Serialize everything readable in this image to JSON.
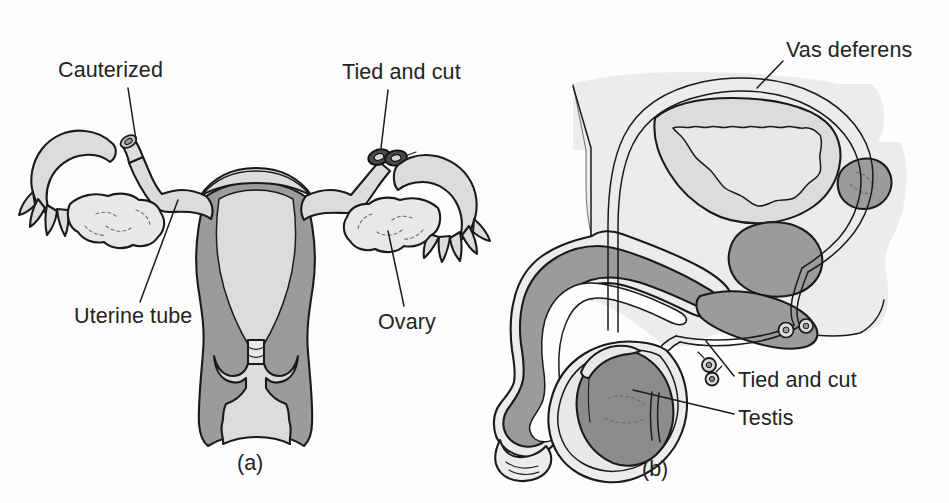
{
  "figure": {
    "kind": "anatomical-diagram",
    "panels": [
      {
        "id": "a",
        "caption": "(a)",
        "subject": "Female reproductive tract — tubal ligation",
        "labels": [
          {
            "id": "cauterized",
            "text": "Cauterized"
          },
          {
            "id": "tied-and-cut",
            "text": "Tied and cut"
          },
          {
            "id": "uterine-tube",
            "text": "Uterine tube"
          },
          {
            "id": "ovary",
            "text": "Ovary"
          }
        ]
      },
      {
        "id": "b",
        "caption": "(b)",
        "subject": "Male reproductive tract — vasectomy",
        "labels": [
          {
            "id": "vas-deferens",
            "text": "Vas deferens"
          },
          {
            "id": "tied-and-cut",
            "text": "Tied and cut"
          },
          {
            "id": "testis",
            "text": "Testis"
          }
        ]
      }
    ]
  },
  "colors": {
    "page_background": "#fdfdfd",
    "outline": "#1a1a1a",
    "tissue_light": "#dcdcdc",
    "tissue_pale": "#e8e8e8",
    "tissue_mid": "#9b9b9b",
    "tissue_dark": "#8c8c8c",
    "body_silhouette": "#ececec",
    "lumen": "#e3e3e3",
    "label_text": "#232323",
    "leader_line": "#1a1a1a"
  },
  "typography": {
    "label_font_size_px": 21.5,
    "caption_font_size_px": 21.5
  }
}
